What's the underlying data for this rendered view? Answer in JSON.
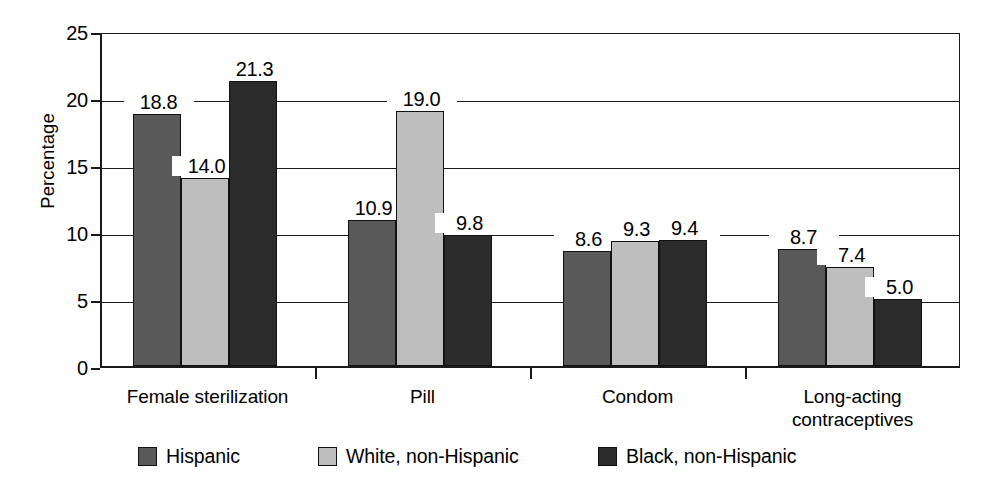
{
  "chart_data": {
    "type": "bar",
    "title": "",
    "xlabel": "",
    "ylabel": "Percentage",
    "ylim": [
      0,
      25
    ],
    "yticks": [
      0,
      5,
      10,
      15,
      20,
      25
    ],
    "ytick_labels": [
      "0",
      "5",
      "10",
      "15",
      "20",
      "25"
    ],
    "grid": true,
    "legend_position": "bottom",
    "categories": [
      "Female sterilization",
      "Pill",
      "Condom",
      "Long-acting contraceptives"
    ],
    "category_lines": [
      [
        "Female sterilization"
      ],
      [
        "Pill"
      ],
      [
        "Condom"
      ],
      [
        "Long-acting",
        "contraceptives"
      ]
    ],
    "series": [
      {
        "name": "Hispanic",
        "color": "#595959",
        "values": [
          18.8,
          10.9,
          8.6,
          8.7
        ],
        "labels": [
          "18.8",
          "10.9",
          "8.6",
          "8.7"
        ]
      },
      {
        "name": "White, non-Hispanic",
        "color": "#bebebe",
        "values": [
          14.0,
          19.0,
          9.3,
          7.4
        ],
        "labels": [
          "14.0",
          "19.0",
          "9.3",
          "7.4"
        ]
      },
      {
        "name": "Black, non-Hispanic",
        "color": "#2b2b2b",
        "values": [
          21.3,
          9.8,
          9.4,
          5.0
        ],
        "labels": [
          "21.3",
          "9.8",
          "9.4",
          "5.0"
        ]
      }
    ]
  },
  "colors": {
    "axis": "#1a1a1a",
    "grid": "#1a1a1a",
    "background": "#ffffff",
    "text": "#000000"
  }
}
